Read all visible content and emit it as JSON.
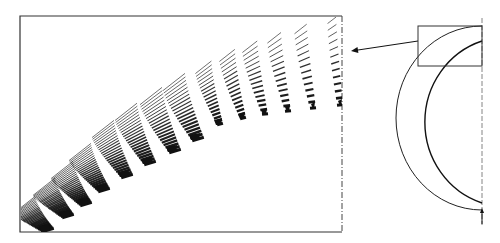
{
  "figure": {
    "width": 500,
    "height": 243,
    "background": "#ffffff",
    "ink": "#111111",
    "main_panel": {
      "frame": {
        "x": 20,
        "y": 16,
        "w": 322,
        "h": 216
      },
      "right_edge_dashed": true,
      "envelope_curve": [
        [
          22,
          205
        ],
        [
          60,
          170
        ],
        [
          110,
          120
        ],
        [
          170,
          82
        ],
        [
          230,
          52
        ],
        [
          290,
          30
        ],
        [
          340,
          16
        ]
      ],
      "bundles": [
        {
          "base": [
            48,
            230
          ],
          "lines": 26,
          "spread": 1.0
        },
        {
          "base": [
            68,
            216
          ],
          "lines": 26,
          "spread": 1.0
        },
        {
          "base": [
            86,
            204
          ],
          "lines": 25,
          "spread": 1.0
        },
        {
          "base": [
            104,
            190
          ],
          "lines": 24,
          "spread": 1.0
        },
        {
          "base": [
            127,
            176
          ],
          "lines": 23,
          "spread": 1.0
        },
        {
          "base": [
            150,
            163
          ],
          "lines": 22,
          "spread": 1.0
        },
        {
          "base": [
            175,
            151
          ],
          "lines": 21,
          "spread": 1.0
        },
        {
          "base": [
            198,
            139
          ],
          "lines": 20,
          "spread": 1.0
        },
        {
          "base": [
            220,
            124
          ],
          "lines": 18,
          "spread": 0.9
        },
        {
          "base": [
            243,
            118
          ],
          "lines": 17,
          "spread": 0.85
        },
        {
          "base": [
            265,
            114
          ],
          "lines": 16,
          "spread": 0.8
        },
        {
          "base": [
            288,
            111
          ],
          "lines": 15,
          "spread": 0.7
        },
        {
          "base": [
            313,
            108
          ],
          "lines": 14,
          "spread": 0.6
        },
        {
          "base": [
            340,
            105
          ],
          "lines": 13,
          "spread": 0.3
        }
      ]
    },
    "pointer_arrow": {
      "from": [
        418,
        41
      ],
      "to": [
        351,
        51
      ]
    },
    "inset": {
      "rect": {
        "x": 418,
        "y": 26,
        "w": 64,
        "h": 40
      },
      "axis_x": 482,
      "axis_y_range": [
        18,
        225
      ],
      "outer_arc": {
        "cx": 482,
        "cy": 118,
        "rx": 86,
        "ry": 92
      },
      "inner_arc": {
        "cx": 482,
        "cy": 118,
        "rx": 82,
        "ry": 85
      },
      "bottom_arrow": {
        "x": 482,
        "y_from": 224,
        "y_to": 208
      }
    }
  }
}
